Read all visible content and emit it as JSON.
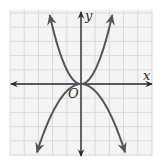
{
  "chart_data": {
    "type": "line",
    "title": "",
    "xlabel": "x",
    "ylabel": "y",
    "origin_label": "O",
    "xlim": [
      -5,
      5
    ],
    "ylim": [
      -5,
      5
    ],
    "grid": true,
    "grid_step": 1,
    "axes_arrows": true,
    "tick_labels": false,
    "legend": null,
    "series": [
      {
        "name": "upper parabola",
        "equation": "y = x^2",
        "x": [
          -2.2,
          -2,
          -1.5,
          -1,
          -0.5,
          0,
          0.5,
          1,
          1.5,
          2,
          2.2
        ],
        "y": [
          4.84,
          4,
          2.25,
          1,
          0.25,
          0,
          0.25,
          1,
          2.25,
          4,
          4.84
        ],
        "arrows_at_ends": true
      },
      {
        "name": "lower parabola",
        "equation": "y = -0.5x^2",
        "x": [
          -3.1,
          -3,
          -2,
          -1,
          0,
          1,
          2,
          3,
          3.1
        ],
        "y": [
          -4.8,
          -4.5,
          -2,
          -0.5,
          0,
          -0.5,
          -2,
          -4.5,
          -4.8
        ],
        "arrows_at_ends": true
      }
    ]
  },
  "colors": {
    "curve": "#555555",
    "axis": "#2b2b2b",
    "grid": "#d9d9d9",
    "background": "#f4f4f4"
  }
}
